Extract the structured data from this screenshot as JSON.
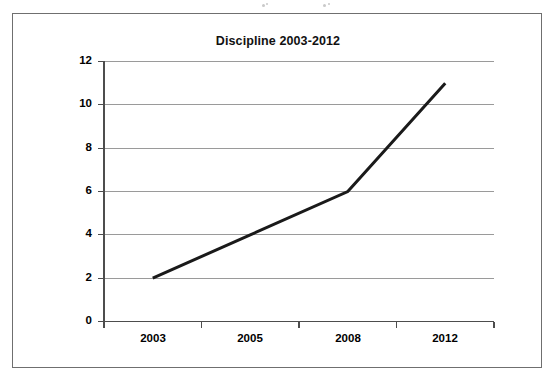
{
  "figure": {
    "frame_border_color": "#6f6f6f",
    "background": "#ffffff"
  },
  "chart_data": {
    "type": "line",
    "title": "Discipline 2003-2012",
    "xlabel": "",
    "ylabel": "",
    "categories": [
      "2003",
      "2005",
      "2008",
      "2012"
    ],
    "values": [
      2,
      4,
      6,
      11
    ],
    "series": [
      {
        "name": "Discipline",
        "values": [
          2,
          4,
          6,
          11
        ],
        "color": "#1a1a1a"
      }
    ],
    "ylim": [
      0,
      12
    ],
    "ytick_step": 2,
    "yticks": [
      "0",
      "2",
      "4",
      "6",
      "8",
      "10",
      "12"
    ],
    "xticks": [
      "2003",
      "2005",
      "2008",
      "2012"
    ],
    "grid": "horizontal",
    "gridline_color": "#9a9a9a",
    "axis_color": "#4d4d4d",
    "line_color": "#1a1a1a",
    "line_width": 3,
    "legend": "none",
    "markers": "none"
  }
}
